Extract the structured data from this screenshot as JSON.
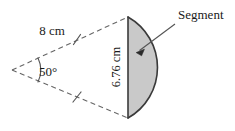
{
  "figure": {
    "type": "geometry-diagram",
    "background_color": "#ffffff",
    "line_color": "#555555",
    "outline_color": "#3a3a3a",
    "segment_fill_color": "#c9c9c9",
    "text_color": "#1a1a1a"
  },
  "labels": {
    "radius": "8 cm",
    "angle": "50°",
    "chord": "6.76 cm",
    "segment": "Segment"
  },
  "geometry": {
    "apex": {
      "x": 12,
      "y": 70
    },
    "top_point": {
      "x": 128,
      "y": 17
    },
    "bottom_point": {
      "x": 128,
      "y": 118
    },
    "arc_bulge_x": 142,
    "tick_upper": {
      "x": 77,
      "y": 40
    },
    "tick_lower": {
      "x": 77,
      "y": 97
    },
    "arrow_tip": {
      "x": 137,
      "y": 52
    },
    "arrow_tail": {
      "x": 175,
      "y": 24
    }
  },
  "measurements": {
    "radius_value": 8,
    "radius_unit": "cm",
    "angle_value": 50,
    "angle_unit": "degrees",
    "chord_value": 6.76,
    "chord_unit": "cm"
  }
}
